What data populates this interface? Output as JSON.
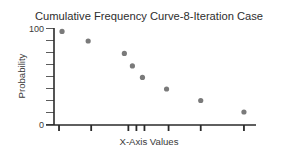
{
  "chart_data": {
    "type": "scatter",
    "title": "Cumulative Frequency Curve-8-Iteration Case",
    "xlabel": "X-Axis Values",
    "ylabel": "Probability",
    "ylim": [
      0,
      100
    ],
    "xlim": [
      0,
      100
    ],
    "y_tick_labels": [
      "0",
      "100"
    ],
    "y_ticks": [
      0,
      12.5,
      25,
      37.5,
      50,
      62.5,
      75,
      87.5,
      100
    ],
    "x_tick_labels": [],
    "x_ticks": [
      2.5,
      18.5,
      37,
      41,
      45,
      57,
      73,
      94.5
    ],
    "grid": false,
    "legend": "none",
    "series": [
      {
        "name": "8-Iteration Case",
        "x": [
          4,
          17,
          35,
          39,
          44,
          56,
          73,
          94.5
        ],
        "y": [
          97,
          87,
          74,
          61,
          49,
          37,
          25,
          13
        ]
      }
    ],
    "colors": {
      "points": "#7a7a7a",
      "axis": "#2a2a2a",
      "text": "#2e2e2e"
    }
  }
}
